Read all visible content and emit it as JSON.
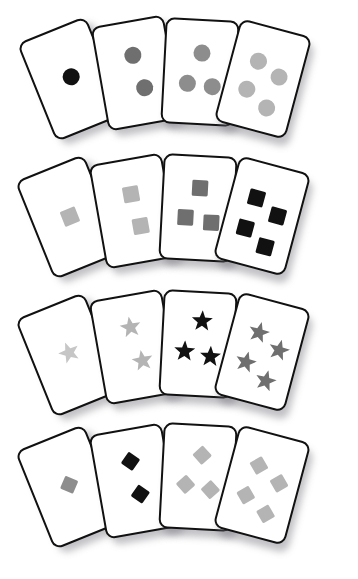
{
  "scene": {
    "title": "Fanned playing cards with counted symbols",
    "background_color": "#ffffff",
    "card_face_color": "#ffffff",
    "card_border_color": "#111111",
    "shadow_color": "#6e6e76"
  },
  "palette": {
    "black": "#111111",
    "dark_gray": "#6f6f6f",
    "medium_gray": "#8d8d8d",
    "light_gray": "#b4b4b4",
    "pale_gray": "#c6c6c6"
  },
  "rows": [
    {
      "row_label": "circles-row",
      "shape": "circle",
      "shape_icon_name": "circle-icon",
      "top": 4,
      "cards": [
        {
          "card_label": "circle-card-1",
          "count": 1,
          "color": "#111111",
          "shade_name": "black",
          "left": 34,
          "top": 22,
          "rotate": -22,
          "pip_positions": [
            [
              52,
              48
            ]
          ]
        },
        {
          "card_label": "circle-card-2",
          "count": 2,
          "color": "#6f6f6f",
          "shade_name": "dark_gray",
          "left": 99,
          "top": 16,
          "rotate": -10,
          "pip_positions": [
            [
              50,
              32
            ],
            [
              58,
              66
            ]
          ]
        },
        {
          "card_label": "circle-card-3",
          "count": 3,
          "color": "#8d8d8d",
          "shade_name": "medium_gray",
          "left": 163,
          "top": 15,
          "rotate": 3,
          "pip_positions": [
            [
              52,
              31
            ],
            [
              33,
              62
            ],
            [
              69,
              64
            ]
          ]
        },
        {
          "card_label": "circle-card-4",
          "count": 4,
          "color": "#b4b4b4",
          "shade_name": "light_gray",
          "left": 226,
          "top": 22,
          "rotate": 15,
          "pip_positions": [
            [
              37,
              34
            ],
            [
              72,
              44
            ],
            [
              32,
              64
            ],
            [
              66,
              76
            ]
          ]
        }
      ]
    },
    {
      "row_label": "squares-row",
      "shape": "square",
      "shape_icon_name": "square-icon",
      "top": 142,
      "cards": [
        {
          "card_label": "square-card-1",
          "count": 1,
          "color": "#b4b4b4",
          "shade_name": "light_gray",
          "left": 32,
          "top": 22,
          "rotate": -22,
          "pip_positions": [
            [
              52,
              50
            ]
          ]
        },
        {
          "card_label": "square-card-2",
          "count": 2,
          "color": "#b4b4b4",
          "shade_name": "light_gray",
          "left": 97,
          "top": 16,
          "rotate": -10,
          "pip_positions": [
            [
              50,
              33
            ],
            [
              56,
              66
            ]
          ]
        },
        {
          "card_label": "square-card-3",
          "count": 3,
          "color": "#6f6f6f",
          "shade_name": "dark_gray",
          "left": 161,
          "top": 13,
          "rotate": 3,
          "pip_positions": [
            [
              52,
              30
            ],
            [
              33,
              60
            ],
            [
              70,
              64
            ]
          ]
        },
        {
          "card_label": "square-card-4",
          "count": 4,
          "color": "#111111",
          "shade_name": "black",
          "left": 225,
          "top": 21,
          "rotate": 15,
          "pip_positions": [
            [
              36,
              34
            ],
            [
              72,
              46
            ],
            [
              31,
              66
            ],
            [
              66,
              78
            ]
          ]
        }
      ]
    },
    {
      "row_label": "stars-row",
      "shape": "star",
      "shape_icon_name": "star-icon",
      "top": 280,
      "cards": [
        {
          "card_label": "star-card-1",
          "count": 1,
          "color": "#c6c6c6",
          "shade_name": "pale_gray",
          "left": 32,
          "top": 22,
          "rotate": -22,
          "pip_positions": [
            [
              52,
              48
            ]
          ]
        },
        {
          "card_label": "star-card-2",
          "count": 2,
          "color": "#b4b4b4",
          "shade_name": "light_gray",
          "left": 97,
          "top": 14,
          "rotate": -10,
          "pip_positions": [
            [
              50,
              30
            ],
            [
              58,
              65
            ]
          ]
        },
        {
          "card_label": "star-card-3",
          "count": 3,
          "color": "#111111",
          "shade_name": "black",
          "left": 161,
          "top": 11,
          "rotate": 3,
          "pip_positions": [
            [
              54,
              27
            ],
            [
              32,
              58
            ],
            [
              68,
              62
            ]
          ]
        },
        {
          "card_label": "star-card-4",
          "count": 4,
          "color": "#6f6f6f",
          "shade_name": "dark_gray",
          "left": 225,
          "top": 19,
          "rotate": 15,
          "pip_positions": [
            [
              38,
              32
            ],
            [
              73,
              44
            ],
            [
              31,
              64
            ],
            [
              66,
              76
            ]
          ]
        }
      ]
    },
    {
      "row_label": "diamonds-row",
      "shape": "diamond",
      "shape_icon_name": "diamond-icon",
      "top": 410,
      "cards": [
        {
          "card_label": "diamond-card-1",
          "count": 1,
          "color": "#8d8d8d",
          "shade_name": "medium_gray",
          "left": 32,
          "top": 24,
          "rotate": -22,
          "pip_positions": [
            [
              52,
              48
            ]
          ]
        },
        {
          "card_label": "diamond-card-2",
          "count": 2,
          "color": "#111111",
          "shade_name": "black",
          "left": 97,
          "top": 18,
          "rotate": -10,
          "pip_positions": [
            [
              50,
              30
            ],
            [
              56,
              64
            ]
          ]
        },
        {
          "card_label": "diamond-card-3",
          "count": 3,
          "color": "#b4b4b4",
          "shade_name": "light_gray",
          "left": 161,
          "top": 14,
          "rotate": 3,
          "pip_positions": [
            [
              54,
              28
            ],
            [
              33,
              58
            ],
            [
              68,
              62
            ]
          ]
        },
        {
          "card_label": "diamond-card-4",
          "count": 4,
          "color": "#b4b4b4",
          "shade_name": "light_gray",
          "left": 225,
          "top": 22,
          "rotate": 15,
          "pip_positions": [
            [
              38,
              32
            ],
            [
              73,
              44
            ],
            [
              31,
              64
            ],
            [
              66,
              76
            ]
          ]
        }
      ]
    }
  ]
}
